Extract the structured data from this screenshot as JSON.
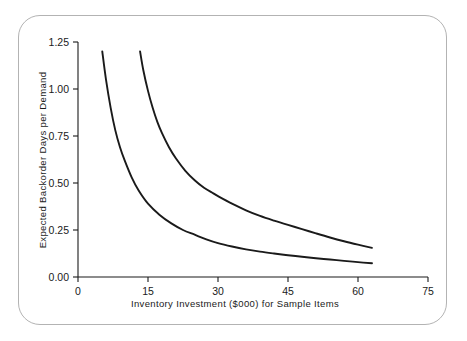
{
  "figure": {
    "frame_color": "#b3b3b3",
    "background": "#ffffff",
    "axis_color": "#1a1a1a"
  },
  "chart_data": {
    "type": "line",
    "title": "",
    "xlabel": "Inventory Investment ($000) for Sample Items",
    "ylabel": "Expected Backorder Days per Demand",
    "xlim": [
      0,
      75
    ],
    "ylim": [
      0.0,
      1.25
    ],
    "xticks": [
      0,
      15,
      30,
      45,
      60,
      75
    ],
    "xticklabels": [
      "0",
      "15",
      "30",
      "45",
      "60",
      "75"
    ],
    "yticks": [
      0.0,
      0.25,
      0.5,
      0.75,
      1.0,
      1.25
    ],
    "yticklabels": [
      "0.00",
      "0.25",
      "0.50",
      "0.75",
      "1.00",
      "1.25"
    ],
    "grid": false,
    "legend": null,
    "series": [
      {
        "name": "lower-curve",
        "color": "#1a1a1a",
        "x": [
          5.2,
          6.0,
          7.0,
          8.0,
          9.0,
          10.0,
          11.5,
          13.0,
          15.0,
          17.5,
          20.0,
          22.5,
          25.0,
          27.5,
          30.0,
          33.0,
          36.0,
          39.0,
          42.0,
          45.0,
          48.0,
          51.0,
          54.0,
          57.0,
          60.0,
          63.0
        ],
        "y": [
          1.2,
          1.05,
          0.9,
          0.78,
          0.69,
          0.62,
          0.53,
          0.46,
          0.39,
          0.33,
          0.285,
          0.25,
          0.225,
          0.2,
          0.18,
          0.162,
          0.147,
          0.135,
          0.125,
          0.116,
          0.108,
          0.1,
          0.093,
          0.086,
          0.079,
          0.073
        ]
      },
      {
        "name": "upper-curve",
        "color": "#1a1a1a",
        "x": [
          13.3,
          14.0,
          15.0,
          16.0,
          17.0,
          18.0,
          19.5,
          21.0,
          23.0,
          25.0,
          27.0,
          29.0,
          30.0,
          33.0,
          36.0,
          39.0,
          42.0,
          45.0,
          48.0,
          51.0,
          54.0,
          57.0,
          60.0,
          63.0
        ],
        "y": [
          1.2,
          1.1,
          0.99,
          0.9,
          0.825,
          0.765,
          0.69,
          0.63,
          0.565,
          0.515,
          0.475,
          0.445,
          0.43,
          0.39,
          0.355,
          0.325,
          0.3,
          0.277,
          0.255,
          0.232,
          0.21,
          0.19,
          0.172,
          0.155
        ]
      }
    ]
  }
}
